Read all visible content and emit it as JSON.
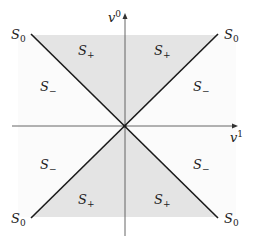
{
  "figure": {
    "type": "light-cone region diagram",
    "axes": {
      "horizontal": {
        "label": "v",
        "superscript": "1"
      },
      "vertical": {
        "label": "v",
        "superscript": "0"
      }
    },
    "regions": {
      "s_plus": {
        "base": "S",
        "sub": "+"
      },
      "s_minus": {
        "base": "S",
        "sub": "−"
      },
      "s_zero": {
        "base": "S",
        "sub": "0"
      }
    },
    "colors": {
      "shaded": "#e4e4e4",
      "unshaded": "#fbfbfb",
      "line": "#1a1a1a",
      "axis": "#555555"
    }
  }
}
